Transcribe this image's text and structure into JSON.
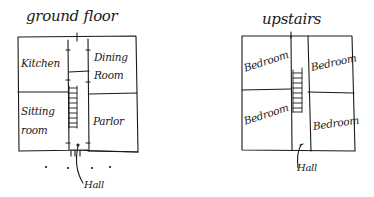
{
  "diagram": {
    "style": "hand-drawn floor plan sketch",
    "ink_color": "#1a1a1a",
    "background": "#ffffff",
    "plans": [
      {
        "id": "ground-floor",
        "title": "ground floor",
        "rooms": [
          {
            "name": "Kitchen",
            "position": "top-left"
          },
          {
            "name": "Dining Room",
            "line1": "Dining",
            "line2": "Room",
            "position": "top-right"
          },
          {
            "name": "Sitting room",
            "line1": "Sitting",
            "line2": "room",
            "position": "bottom-left"
          },
          {
            "name": "Parlor",
            "position": "bottom-right"
          }
        ],
        "central": {
          "hall_label": "Hall",
          "has_stairs": true
        },
        "entrance_dots": 4
      },
      {
        "id": "upstairs",
        "title": "upstairs",
        "rooms": [
          {
            "name": "Bedroom",
            "position": "top-left"
          },
          {
            "name": "Bedroom",
            "position": "top-right"
          },
          {
            "name": "Bedroom",
            "position": "bottom-left"
          },
          {
            "name": "Bedroom",
            "position": "bottom-right"
          }
        ],
        "central": {
          "hall_label": "Hall",
          "has_stairs": true
        }
      }
    ]
  }
}
